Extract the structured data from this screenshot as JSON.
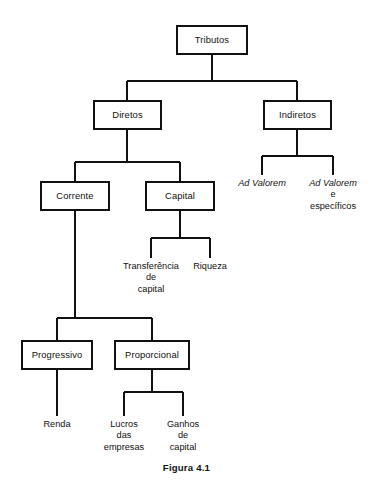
{
  "figure": {
    "caption": "Figura 4.1",
    "caption_top": 462,
    "line_color": "#111111",
    "box_border_color": "#111111",
    "background_color": "#ffffff"
  },
  "nodes": {
    "tributos": {
      "label": "Tributos",
      "x": 176,
      "y": 25,
      "w": 72,
      "h": 30
    },
    "diretos": {
      "label": "Diretos",
      "x": 93,
      "y": 100,
      "w": 69,
      "h": 30
    },
    "indiretos": {
      "label": "Indiretos",
      "x": 263,
      "y": 100,
      "w": 69,
      "h": 30
    },
    "corrente": {
      "label": "Corrente",
      "x": 40,
      "y": 181,
      "w": 70,
      "h": 30
    },
    "capital": {
      "label": "Capital",
      "x": 145,
      "y": 181,
      "w": 70,
      "h": 30
    },
    "progressivo": {
      "label": "Progressivo",
      "x": 21,
      "y": 340,
      "w": 72,
      "h": 30
    },
    "proporcional": {
      "label": "Proporcional",
      "x": 114,
      "y": 340,
      "w": 76,
      "h": 30
    }
  },
  "leaves": {
    "ad_valorem": {
      "lines": [
        "Ad Valorem"
      ],
      "italic": true,
      "cx": 262,
      "top": 178,
      "w": 74
    },
    "ad_valorem_especificos": {
      "lines": [
        "Ad Valorem",
        "e",
        "específicos"
      ],
      "italic_first_line": true,
      "cx": 333,
      "top": 178,
      "w": 76
    },
    "transferencia_de_capital": {
      "lines": [
        "Transferência",
        "de",
        "capital"
      ],
      "italic": false,
      "cx": 151,
      "top": 261,
      "w": 74
    },
    "riqueza": {
      "lines": [
        "Riqueza"
      ],
      "italic": false,
      "cx": 210,
      "top": 261,
      "w": 54
    },
    "renda": {
      "lines": [
        "Renda"
      ],
      "italic": false,
      "cx": 57,
      "top": 419,
      "w": 54
    },
    "lucros_das_empresas": {
      "lines": [
        "Lucros",
        "das",
        "empresas"
      ],
      "italic": false,
      "cx": 124,
      "top": 419,
      "w": 66
    },
    "ganhos_de_capital": {
      "lines": [
        "Ganhos",
        "de",
        "capital"
      ],
      "italic": false,
      "cx": 183,
      "top": 419,
      "w": 60
    }
  },
  "hierarchy": {
    "root": "Tributos",
    "level_1": [
      "Diretos",
      "Indiretos"
    ],
    "diretos_children": [
      "Corrente",
      "Capital"
    ],
    "indiretos_children": [
      "Ad Valorem",
      "Ad Valorem e específicos"
    ],
    "capital_children": [
      "Transferência de capital",
      "Riqueza"
    ],
    "corrente_children": [
      "Progressivo",
      "Proporcional"
    ],
    "progressivo_children": [
      "Renda"
    ],
    "proporcional_children": [
      "Lucros das empresas",
      "Ganhos de capital"
    ]
  }
}
